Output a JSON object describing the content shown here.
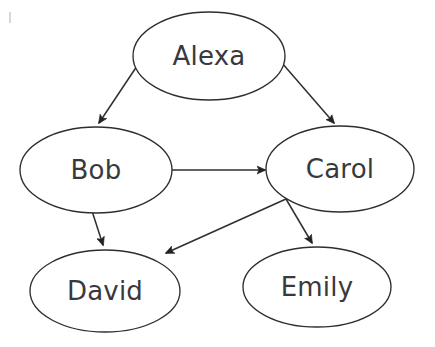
{
  "diagram": {
    "background_color": "#ffffff",
    "node_fill": "#ffffff",
    "node_stroke": "#2e2e32",
    "label_color": "#39393d",
    "edge_color": "#2e2e32",
    "nodes": [
      {
        "id": "alexa",
        "label": "Alexa",
        "cx": 209,
        "cy": 56,
        "rx": 76,
        "ry": 44
      },
      {
        "id": "bob",
        "label": "Bob",
        "cx": 96,
        "cy": 170,
        "rx": 76,
        "ry": 43
      },
      {
        "id": "carol",
        "label": "Carol",
        "cx": 340,
        "cy": 169,
        "rx": 74,
        "ry": 43
      },
      {
        "id": "david",
        "label": "David",
        "cx": 105,
        "cy": 291,
        "rx": 75,
        "ry": 41
      },
      {
        "id": "emily",
        "label": "Emily",
        "cx": 317,
        "cy": 287,
        "rx": 74,
        "ry": 40
      }
    ],
    "edges": [
      {
        "id": "alexa-bob",
        "from": "Alexa",
        "to": "Bob",
        "directed": true,
        "x1": 137,
        "y1": 66,
        "x2": 99,
        "y2": 123
      },
      {
        "id": "alexa-carol",
        "from": "Alexa",
        "to": "Carol",
        "directed": true,
        "x1": 282,
        "y1": 63,
        "x2": 334,
        "y2": 123
      },
      {
        "id": "bob-carol",
        "from": "Bob",
        "to": "Carol",
        "directed": true,
        "x1": 172,
        "y1": 170,
        "x2": 265,
        "y2": 170
      },
      {
        "id": "bob-david",
        "from": "Bob",
        "to": "David",
        "directed": true,
        "x1": 92,
        "y1": 211,
        "x2": 103,
        "y2": 245
      },
      {
        "id": "carol-david",
        "from": "Carol",
        "to": "David",
        "directed": true,
        "x1": 286,
        "y1": 199,
        "x2": 166,
        "y2": 253
      },
      {
        "id": "carol-emily",
        "from": "Carol",
        "to": "Emily",
        "directed": true,
        "x1": 286,
        "y1": 199,
        "x2": 312,
        "y2": 243
      }
    ]
  }
}
